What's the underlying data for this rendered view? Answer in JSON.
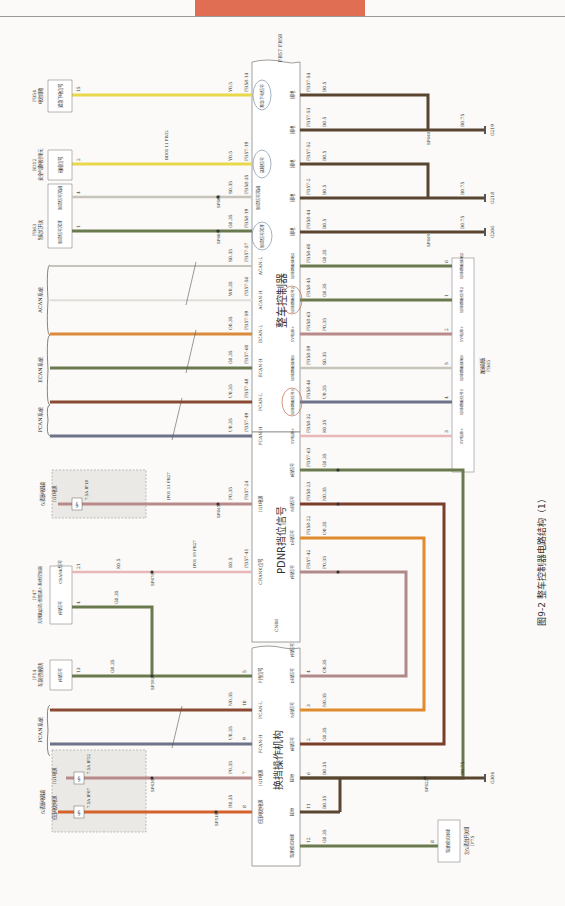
{
  "header": {
    "tab_color": "#e06e52"
  },
  "figure": {
    "caption": "图9-2  整车控制器电路结构（1）",
    "vcu_title": "整车控制器",
    "vcu_connectors": "FB57 FB58",
    "pdnr_title": "PDNR挡位信号",
    "pdnr_connector": "CN06",
    "shifter_title": "换挡操作机构"
  },
  "top_components": {
    "fb54": {
      "id": "FB54",
      "name": "电池组箱",
      "pin_label": "紧急下电信号",
      "pin": "15"
    },
    "bd12": {
      "id": "BD12",
      "name": "安全气囊电控单元",
      "pin_label": "碰撞信号",
      "pin": "2"
    },
    "fb63": {
      "id": "FB63",
      "name": "制动灯开关",
      "pin_label_nc": "制动信号常闭",
      "pin_nc": "4",
      "pin_label_no": "制动信号常开",
      "pin_no": "1"
    },
    "acan": {
      "name": "ACAN系统"
    },
    "ecan": {
      "name": "ECAN系统"
    },
    "pcan": {
      "name": "PCAN系统"
    }
  },
  "vcu_pins_left": [
    {
      "pin": "FB58-14",
      "wire": "Y0.5",
      "label": "紧急下电信号",
      "color": "#e8d84a"
    },
    {
      "pin": "FB57-19",
      "wire": "Y0.5",
      "label": "碰撞信号",
      "color": "#e8d84a",
      "inline": "BD05 11 FB32"
    },
    {
      "pin": "FB58-35",
      "wire": "S0.35",
      "label": "制动信号常闭",
      "color": "#c7c4bc",
      "splice": "SP605"
    },
    {
      "pin": "FB58-19",
      "wire": "G0.35",
      "label": "制动信号常开",
      "color": "#6b7a4e",
      "splice": "SP603"
    },
    {
      "pin": "FB57-57",
      "wire": "S0.35",
      "label": "ACAN-L",
      "color": "#c7c4bc"
    },
    {
      "pin": "FB57-56",
      "wire": "W0.35",
      "label": "ACAN-H",
      "color": "#e6e4de"
    },
    {
      "pin": "FB57-59",
      "wire": "O0.35",
      "label": "ECAN-L",
      "color": "#d98a3a"
    },
    {
      "pin": "FB57-60",
      "wire": "G0.35",
      "label": "ECAN-H",
      "color": "#6b7a4e"
    },
    {
      "pin": "FB57-48",
      "wire": "U0.35",
      "label": "PCAN-L",
      "color": "#8a4a32"
    },
    {
      "pin": "FB57-49",
      "wire": "U0.35",
      "label": "PCAN-H",
      "color": "#6d7388"
    },
    {
      "pin": "FB57-24",
      "wire": "P0.35",
      "label": "IG1电源",
      "color": "#b88a8a",
      "splice": "SP645"
    },
    {
      "pin": "FB57-41",
      "wire": "K0.5",
      "label": "CRANK信号",
      "color": "#e8b8b8",
      "splice": "SP670"
    }
  ],
  "vcu_pins_right": [
    {
      "pin": "FB57-54",
      "wire": "B0.5",
      "label": "接地"
    },
    {
      "pin": "FB57-53",
      "wire": "B0.5",
      "label": "接地"
    },
    {
      "pin": "FB57-52",
      "wire": "B0.5",
      "label": "接地"
    },
    {
      "pin": "FB57-2",
      "wire": "B0.5",
      "label": "接地"
    },
    {
      "pin": "FB58-44",
      "wire": "B0.5",
      "label": "接地"
    },
    {
      "pin": "FB58-60",
      "wire": "G0.35",
      "label": "加速踏板接地2"
    },
    {
      "pin": "FB58-45",
      "wire": "G0.35",
      "label": "加速踏板信号2"
    },
    {
      "pin": "FB58-63",
      "wire": "P0.35",
      "label": "5V电源+"
    },
    {
      "pin": "FB58-59",
      "wire": "S0.35",
      "label": "加速踏板接地1"
    },
    {
      "pin": "FB58-46",
      "wire": "U0.35",
      "label": "加速踏板信号1"
    },
    {
      "pin": "FB58-32",
      "wire": "K0.35",
      "label": "5V电源+"
    },
    {
      "pin": "FB57-63",
      "wire": "G0.35",
      "label": "R挡信号"
    },
    {
      "pin": "FB58-23",
      "wire": "N0.35",
      "label": "N挡信号"
    },
    {
      "pin": "FB58-22",
      "wire": "O0.35",
      "label": "D挡信号"
    },
    {
      "pin": "FB57-42",
      "wire": "P0.35",
      "label": "P挡信号"
    }
  ],
  "grounds": [
    {
      "id": "G219",
      "wire": "B0.75",
      "splice": "SP640"
    },
    {
      "id": "G218",
      "wire": "B0.75"
    },
    {
      "id": "G206",
      "wire": "B0.75",
      "splice": "SP649"
    },
    {
      "id": "G304",
      "wire": "B0.75",
      "splice": "SP622"
    }
  ],
  "accel_pedal": {
    "id": "FB65",
    "name": "加速踏板",
    "pins": [
      {
        "pin": "6",
        "label": "加速踏板接地2"
      },
      {
        "pin": "1",
        "label": "加速踏板信号2"
      },
      {
        "pin": "2",
        "label": "5V电源+"
      },
      {
        "pin": "5",
        "label": "加速踏板接地1"
      },
      {
        "pin": "4",
        "label": "加速踏板信号1"
      },
      {
        "pin": "3",
        "label": "5V电源+"
      }
    ]
  },
  "fusebox_ig1": {
    "name": "仪表板电器盒",
    "label": "IG1电源",
    "fuse": "7.5A IF18",
    "inline": "IP01 11 FB27"
  },
  "ip47": {
    "id": "IP47",
    "name": "无钥匙启动/智能进入系统控制器",
    "pins": [
      {
        "pin": "21",
        "label": "CRANK信号",
        "wire": "K0.5"
      },
      {
        "pin": "4",
        "label": "P挡信号",
        "wire": "G0.35"
      }
    ],
    "inline": "IP01 19 FB27"
  },
  "ip14": {
    "id": "IP14",
    "name": "车身控制模块",
    "pin_label": "P挡信号",
    "pin": "13",
    "wire": "G0.35",
    "splice": "SP592"
  },
  "fusebox_main": {
    "name": "仪表板电器盒",
    "labels": [
      "低压电池电源",
      "IG1电源"
    ],
    "fuses": [
      "7.5A IF07",
      "7.5A IF22"
    ],
    "splices": [
      "SP518",
      "SP630"
    ]
  },
  "shifter_pins_left": [
    {
      "pin": "8",
      "wire": "R0.35",
      "label": "低压电池电源"
    },
    {
      "pin": "7",
      "wire": "P0.35",
      "label": "IG1电源"
    },
    {
      "pin": "9",
      "wire": "U0.35",
      "label": "PCAN-H"
    },
    {
      "pin": "10",
      "wire": "N0.35",
      "label": "PCAN-L"
    },
    {
      "pin": "5",
      "wire": "G0.35",
      "label": "P挡信号"
    }
  ],
  "shifter_pins_right": [
    {
      "pin": "12",
      "wire": "G0.35",
      "label": "驾驶模式按键"
    },
    {
      "pin": "11",
      "wire": "B0.35",
      "label": "接地"
    },
    {
      "pin": "6",
      "wire": "B0.35",
      "label": "接地"
    },
    {
      "pin": "2",
      "wire": "G0.35",
      "label": "R挡信号"
    },
    {
      "pin": "3",
      "wire": "N0.35",
      "label": "N挡信号"
    },
    {
      "pin": "4",
      "wire": "O0.35",
      "label": "D挡信号"
    },
    {
      "pin": "1",
      "wire": "P0.35",
      "label": "P挡信号"
    }
  ],
  "ip75": {
    "id": "IP75",
    "name": "左仪表台开关组",
    "pin": "8",
    "label": "驾驶模式按键"
  }
}
